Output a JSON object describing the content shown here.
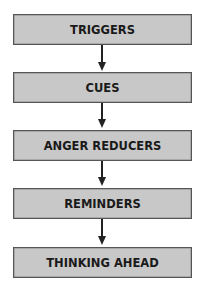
{
  "diagram": {
    "type": "vertical-flowchart",
    "steps": [
      {
        "label": "TRIGGERS"
      },
      {
        "label": "CUES"
      },
      {
        "label": "ANGER REDUCERS"
      },
      {
        "label": "REMINDERS"
      },
      {
        "label": "THINKING AHEAD"
      }
    ],
    "colors": {
      "box_fill": "#c8c8c8",
      "box_border": "#555555",
      "text": "#1a1a1a",
      "arrow": "#222222"
    }
  }
}
